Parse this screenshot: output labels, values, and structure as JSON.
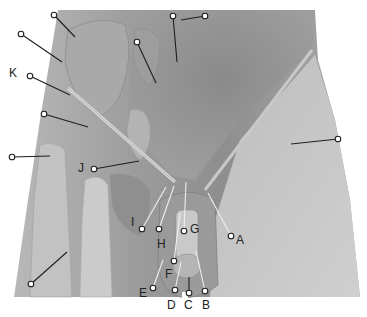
{
  "figure": {
    "colors": {
      "background": "#ffffff",
      "skin_mid": "#9a9a9a",
      "skin_light": "#c4c4c4",
      "skin_dark": "#6e6e6e",
      "pin": "#ffffff",
      "line": "#222222"
    },
    "labels": [
      {
        "id": "A",
        "text": "A",
        "x": 236,
        "y": 234
      },
      {
        "id": "B",
        "text": "B",
        "x": 202,
        "y": 299
      },
      {
        "id": "C",
        "text": "C",
        "x": 184,
        "y": 299
      },
      {
        "id": "D",
        "text": "D",
        "x": 167,
        "y": 299
      },
      {
        "id": "E",
        "text": "E",
        "x": 139,
        "y": 287
      },
      {
        "id": "F",
        "text": "F",
        "x": 165,
        "y": 268
      },
      {
        "id": "G",
        "text": "G",
        "x": 190,
        "y": 223
      },
      {
        "id": "H",
        "text": "H",
        "x": 157,
        "y": 238
      },
      {
        "id": "I",
        "text": "I",
        "x": 131,
        "y": 216
      },
      {
        "id": "J",
        "text": "J",
        "x": 78,
        "y": 162
      },
      {
        "id": "K",
        "text": "K",
        "x": 9,
        "y": 67
      }
    ],
    "pins": [
      {
        "label": "",
        "pin": [
          54,
          15
        ],
        "end": [
          75,
          37
        ]
      },
      {
        "label": "",
        "pin": [
          21,
          34
        ],
        "end": [
          62,
          62
        ]
      },
      {
        "label": "",
        "pin": [
          137,
          42
        ],
        "end": [
          156,
          83
        ]
      },
      {
        "label": "",
        "pin": [
          173,
          16
        ],
        "end": [
          177,
          62
        ]
      },
      {
        "label": "",
        "pin": [
          205,
          16
        ],
        "end": [
          181,
          20
        ]
      },
      {
        "label": "K",
        "pin": [
          30,
          76
        ],
        "end": [
          70,
          95
        ]
      },
      {
        "label": "",
        "pin": [
          44,
          114
        ],
        "end": [
          88,
          127
        ]
      },
      {
        "label": "",
        "pin": [
          12,
          157
        ],
        "end": [
          50,
          156
        ]
      },
      {
        "label": "",
        "pin": [
          338,
          139
        ],
        "end": [
          291,
          144
        ]
      },
      {
        "label": "J",
        "pin": [
          94,
          169
        ],
        "end": [
          139,
          161
        ]
      },
      {
        "label": "",
        "pin": [
          31,
          284
        ],
        "end": [
          67,
          252
        ]
      },
      {
        "label": "I",
        "pin": [
          142,
          229
        ],
        "end": [
          166,
          187
        ]
      },
      {
        "label": "H",
        "pin": [
          159,
          229
        ],
        "end": [
          174,
          186
        ]
      },
      {
        "label": "G",
        "pin": [
          184,
          231
        ],
        "end": [
          186,
          182
        ]
      },
      {
        "label": "A",
        "pin": [
          231,
          236
        ],
        "end": [
          208,
          193
        ]
      },
      {
        "label": "F",
        "pin": [
          174,
          261
        ],
        "end": [
          180,
          213
        ]
      },
      {
        "label": "E",
        "pin": [
          153,
          288
        ],
        "end": [
          163,
          260
        ]
      },
      {
        "label": "D",
        "pin": [
          175,
          290
        ],
        "end": [
          181,
          262
        ]
      },
      {
        "label": "C",
        "pin": [
          189,
          293
        ],
        "end": [
          189,
          277
        ]
      },
      {
        "label": "B",
        "pin": [
          205,
          291
        ],
        "end": [
          196,
          251
        ]
      }
    ]
  }
}
